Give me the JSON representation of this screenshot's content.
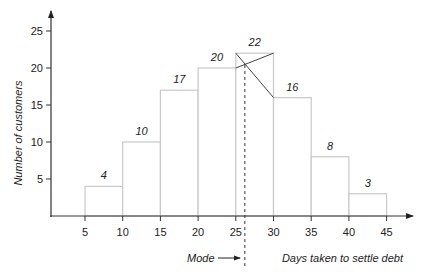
{
  "chart_data": {
    "type": "bar",
    "subtype": "histogram",
    "title": "",
    "xlabel": "Days taken to settle debt",
    "ylabel": "Number of customers",
    "x_ticks": [
      5,
      10,
      15,
      20,
      25,
      30,
      35,
      40,
      45
    ],
    "y_ticks": [
      5,
      10,
      15,
      20,
      25
    ],
    "xlim": [
      0,
      48
    ],
    "ylim": [
      0,
      27
    ],
    "grid": false,
    "legend": null,
    "bins": [
      {
        "from": 5,
        "to": 10,
        "value": 4,
        "label": "4"
      },
      {
        "from": 10,
        "to": 15,
        "value": 10,
        "label": "10"
      },
      {
        "from": 15,
        "to": 20,
        "value": 17,
        "label": "17"
      },
      {
        "from": 20,
        "to": 25,
        "value": 20,
        "label": "20"
      },
      {
        "from": 25,
        "to": 30,
        "value": 22,
        "label": "22"
      },
      {
        "from": 30,
        "to": 35,
        "value": 16,
        "label": "16"
      },
      {
        "from": 35,
        "to": 40,
        "value": 8,
        "label": "8"
      },
      {
        "from": 40,
        "to": 45,
        "value": 3,
        "label": "3"
      }
    ],
    "categories": [
      "5-10",
      "10-15",
      "15-20",
      "20-25",
      "25-30",
      "30-35",
      "35-40",
      "40-45"
    ],
    "values": [
      4,
      10,
      17,
      20,
      22,
      16,
      8,
      3
    ],
    "annotations": [
      {
        "type": "mode-construction",
        "description": "Crossing lines from modal bar corners to adjacent bar tops",
        "lines": [
          [
            [
              25,
              22
            ],
            [
              30,
              16
            ]
          ],
          [
            [
              25,
              20
            ],
            [
              30,
              22
            ]
          ]
        ]
      },
      {
        "type": "dashed-vertical",
        "x": 26.2,
        "label": "Mode",
        "arrow": "right"
      }
    ],
    "mode_estimate": 26.2
  }
}
